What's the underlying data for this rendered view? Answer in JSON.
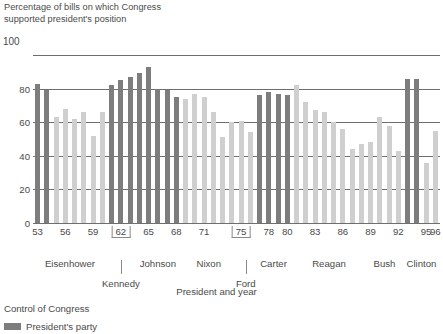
{
  "chart_data": {
    "type": "bar",
    "title": "Percentage of bills on which Congress\nsupported president's position",
    "xlabel": "President and year",
    "ylabel": "",
    "ylim": [
      0,
      100
    ],
    "yticks": [
      0,
      20,
      40,
      60,
      80,
      100
    ],
    "grid": true,
    "legend_position": "below",
    "legend_title": "Control of Congress",
    "legend_entries": [
      {
        "label": "President's party",
        "color": "#7d7d7d"
      }
    ],
    "colors": {
      "president_party": "#7d7d7d",
      "opposition_party": "#cfcfcf"
    },
    "categories": [
      "53",
      "54",
      "55",
      "56",
      "57",
      "58",
      "59",
      "60",
      "61",
      "62",
      "63",
      "64",
      "65",
      "66",
      "67",
      "68",
      "69",
      "70",
      "71",
      "72",
      "73",
      "74",
      "75",
      "76",
      "77",
      "78",
      "79",
      "80",
      "81",
      "82",
      "83",
      "84",
      "85",
      "86",
      "87",
      "88",
      "89",
      "90",
      "91",
      "92",
      "93",
      "94",
      "95",
      "96"
    ],
    "values": [
      83,
      79,
      63,
      68,
      62,
      66,
      52,
      66,
      82,
      85,
      87,
      89,
      93,
      80,
      79,
      75,
      74,
      77,
      75,
      66,
      51,
      60,
      61,
      54,
      76,
      78,
      77,
      76,
      82,
      72,
      67,
      66,
      60,
      56,
      44,
      47,
      48,
      63,
      58,
      43,
      86,
      86,
      36,
      55
    ],
    "bar_colors": [
      "dark",
      "dark",
      "light",
      "light",
      "light",
      "light",
      "light",
      "light",
      "dark",
      "dark",
      "dark",
      "dark",
      "dark",
      "dark",
      "dark",
      "dark",
      "light",
      "light",
      "light",
      "light",
      "light",
      "light",
      "light",
      "light",
      "dark",
      "dark",
      "dark",
      "dark",
      "light",
      "light",
      "light",
      "light",
      "light",
      "light",
      "light",
      "light",
      "light",
      "light",
      "light",
      "light",
      "dark",
      "dark",
      "light",
      "light"
    ],
    "xtick_labels": [
      {
        "year": "53",
        "bracketed": false
      },
      {
        "year": "56",
        "bracketed": false
      },
      {
        "year": "59",
        "bracketed": false
      },
      {
        "year": "62",
        "bracketed": true
      },
      {
        "year": "65",
        "bracketed": false
      },
      {
        "year": "68",
        "bracketed": false
      },
      {
        "year": "71",
        "bracketed": false
      },
      {
        "year": "75",
        "bracketed": true
      },
      {
        "year": "78",
        "bracketed": false
      },
      {
        "year": "80",
        "bracketed": false
      },
      {
        "year": "83",
        "bracketed": false
      },
      {
        "year": "86",
        "bracketed": false
      },
      {
        "year": "89",
        "bracketed": false
      },
      {
        "year": "92",
        "bracketed": false
      },
      {
        "year": "95",
        "bracketed": false
      },
      {
        "year": "96",
        "bracketed": false
      }
    ],
    "presidents": [
      {
        "name": "Eisenhower",
        "start": "53",
        "end": "60"
      },
      {
        "name": "Kennedy",
        "start": "61",
        "end": "63"
      },
      {
        "name": "Johnson",
        "start": "64",
        "end": "68"
      },
      {
        "name": "Nixon",
        "start": "69",
        "end": "74"
      },
      {
        "name": "Ford",
        "start": "75",
        "end": "76"
      },
      {
        "name": "Carter",
        "start": "77",
        "end": "80"
      },
      {
        "name": "Reagan",
        "start": "81",
        "end": "88"
      },
      {
        "name": "Bush",
        "start": "89",
        "end": "92"
      },
      {
        "name": "Clinton",
        "start": "93",
        "end": "96"
      }
    ]
  }
}
